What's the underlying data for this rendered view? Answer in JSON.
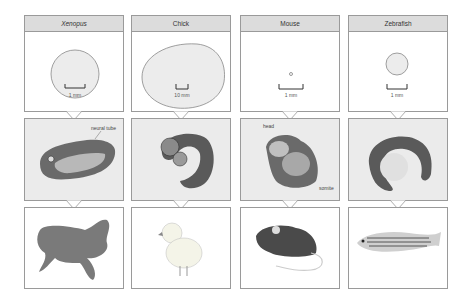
{
  "columns": [
    {
      "organism": "Xenopus",
      "italic": true,
      "scale_label": "1 mm",
      "embryo_labels": [
        "neural tube"
      ]
    },
    {
      "organism": "Chick",
      "italic": false,
      "scale_label": "10 mm",
      "embryo_labels": []
    },
    {
      "organism": "Mouse",
      "italic": false,
      "scale_label": "1 mm",
      "embryo_labels": [
        "head",
        "somite"
      ]
    },
    {
      "organism": "Zebrafish",
      "italic": false,
      "scale_label": "1 mm",
      "embryo_labels": []
    }
  ],
  "colors": {
    "header_bg": "#dcdcdc",
    "embryo_bg": "#ebebeb",
    "border": "#9a9a9a"
  }
}
